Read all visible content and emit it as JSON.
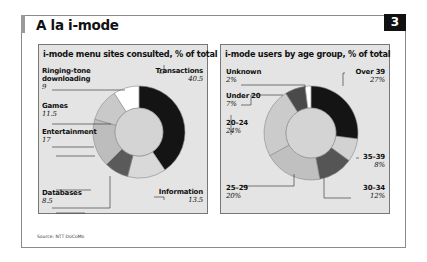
{
  "header": {
    "title": "A la i-mode",
    "number": "3"
  },
  "source": "Source: NTT DoCoMo",
  "panels": [
    {
      "title": "i-mode menu sites consulted, % of total"
    },
    {
      "title": "i-mode users by age group, % of total"
    }
  ],
  "chart_data": [
    {
      "type": "pie",
      "variant": "donut",
      "title": "i-mode menu sites consulted, % of total",
      "categories": [
        "Transactions",
        "Information",
        "Databases",
        "Entertainment",
        "Games",
        "Ringing-tone downloading"
      ],
      "values": [
        40.5,
        13.5,
        8.5,
        17,
        11.5,
        9
      ],
      "labels": [
        "40.5",
        "13.5",
        "8.5",
        "17",
        "11.5",
        "9"
      ],
      "colors": [
        "#141414",
        "#d9d9d9",
        "#5a5a5a",
        "#bdbdbd",
        "#c9c9c9",
        "#ffffff"
      ],
      "start": "12 o'clock, clockwise"
    },
    {
      "type": "pie",
      "variant": "donut",
      "title": "i-mode users by age group, % of total",
      "categories": [
        "Over 39",
        "35–39",
        "30–34",
        "25–29",
        "20–24",
        "Under 20",
        "Unknown"
      ],
      "values": [
        27,
        8,
        12,
        20,
        24,
        7,
        2
      ],
      "labels": [
        "27%",
        "8%",
        "12%",
        "20%",
        "24%",
        "7%",
        "2%"
      ],
      "colors": [
        "#141414",
        "#d2d2d2",
        "#555555",
        "#c0c0c0",
        "#cbcbcb",
        "#4a4a4a",
        "#ffffff"
      ],
      "start": "12 o'clock, clockwise"
    }
  ]
}
